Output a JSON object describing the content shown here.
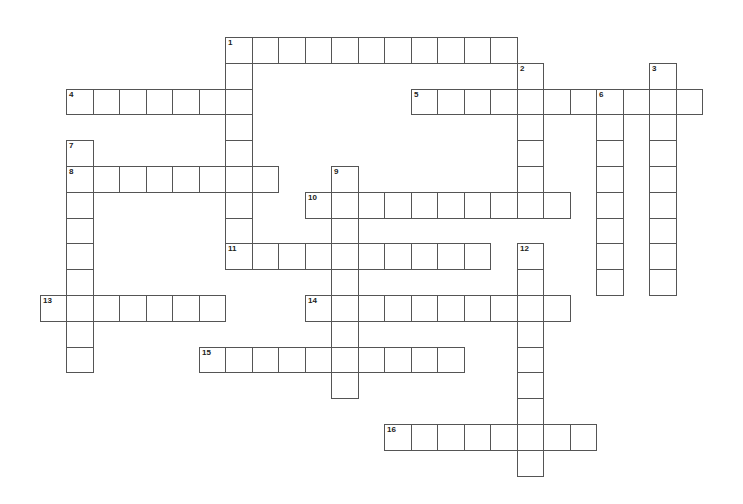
{
  "puzzle": {
    "type": "crossword",
    "cell_width": 26.5,
    "cell_height": 25.8,
    "origin_x": 66,
    "origin_y": 37,
    "colors": {
      "border": "#555555",
      "background": "#ffffff",
      "number": "#222222"
    },
    "entries": [
      {
        "number": "1",
        "direction": "across",
        "col": 6,
        "row": 0,
        "length": 11
      },
      {
        "number": "1",
        "direction": "down",
        "col": 6,
        "row": 0,
        "length": 9
      },
      {
        "number": "2",
        "direction": "down",
        "col": 17,
        "row": 1,
        "length": 6
      },
      {
        "number": "3",
        "direction": "down",
        "col": 22,
        "row": 1,
        "length": 9
      },
      {
        "number": "4",
        "direction": "across",
        "col": 0,
        "row": 2,
        "length": 7
      },
      {
        "number": "5",
        "direction": "across",
        "col": 13,
        "row": 2,
        "length": 11
      },
      {
        "number": "6",
        "direction": "down",
        "col": 20,
        "row": 2,
        "length": 8
      },
      {
        "number": "7",
        "direction": "down",
        "col": 0,
        "row": 4,
        "length": 9
      },
      {
        "number": "8",
        "direction": "across",
        "col": 0,
        "row": 5,
        "length": 8
      },
      {
        "number": "9",
        "direction": "down",
        "col": 10,
        "row": 5,
        "length": 9
      },
      {
        "number": "10",
        "direction": "across",
        "col": 9,
        "row": 6,
        "length": 10
      },
      {
        "number": "11",
        "direction": "across",
        "col": 6,
        "row": 8,
        "length": 10
      },
      {
        "number": "12",
        "direction": "down",
        "col": 17,
        "row": 8,
        "length": 9
      },
      {
        "number": "13",
        "direction": "across",
        "col": -1,
        "row": 10,
        "length": 7
      },
      {
        "number": "14",
        "direction": "across",
        "col": 9,
        "row": 10,
        "length": 10
      },
      {
        "number": "15",
        "direction": "across",
        "col": 5,
        "row": 12,
        "length": 10
      },
      {
        "number": "16",
        "direction": "across",
        "col": 12,
        "row": 15,
        "length": 8
      }
    ]
  }
}
